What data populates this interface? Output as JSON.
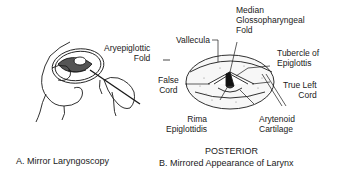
{
  "panel_a": {
    "caption": "A. Mirror Laryngoscopy",
    "labels": {
      "aryepiglottic_1": "Aryepiglottic",
      "aryepiglottic_2": "Fold"
    }
  },
  "panel_b": {
    "caption": "B. Mirrored Appearance of Larynx",
    "orientation": "POSTERIOR",
    "labels": {
      "median_1": "Median",
      "median_2": "Glossopharyngeal",
      "median_3": "Fold",
      "vallecula": "Vallecula",
      "tubercle_1": "Tubercle of",
      "tubercle_2": "Epiglottis",
      "false_1": "False",
      "false_2": "Cord",
      "true_1": "True Left",
      "true_2": "Cord",
      "rima_1": "Rima",
      "rima_2": "Epiglottidis",
      "arytenoid_1": "Arytenoid",
      "arytenoid_2": "Cartilage"
    }
  }
}
